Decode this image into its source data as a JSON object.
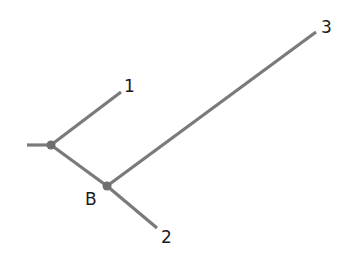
{
  "diagram": {
    "type": "phylogenetic-tree",
    "colors": {
      "edge": "#7a7a7a",
      "node": "#6f6f6f",
      "label": "#1a1a1a",
      "background": "#ffffff"
    },
    "nodes": [
      {
        "id": "A",
        "label": "",
        "x": 51,
        "y": 145,
        "internal": true
      },
      {
        "id": "B",
        "label": "B",
        "x": 107,
        "y": 186,
        "internal": true
      },
      {
        "id": "1",
        "label": "1",
        "x": 121,
        "y": 92,
        "internal": false
      },
      {
        "id": "2",
        "label": "2",
        "x": 157,
        "y": 228,
        "internal": false
      },
      {
        "id": "3",
        "label": "3",
        "x": 316,
        "y": 32,
        "internal": false
      }
    ],
    "edges": [
      {
        "from": "root",
        "to": "A"
      },
      {
        "from": "A",
        "to": "1"
      },
      {
        "from": "A",
        "to": "B"
      },
      {
        "from": "B",
        "to": "2"
      },
      {
        "from": "B",
        "to": "3"
      }
    ],
    "labels": {
      "leaf1": "1",
      "leaf2": "2",
      "leaf3": "3",
      "nodeB": "B"
    }
  }
}
